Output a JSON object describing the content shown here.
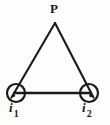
{
  "figure": {
    "name": "triangular-current-loop-diagram",
    "background_color": "#fdfdfc",
    "stroke_color": "#1a1a1a",
    "width": 110,
    "height": 125
  },
  "labels": {
    "apex": "P",
    "node_1_symbol": "i",
    "node_1_subscript": "1",
    "node_2_symbol": "i",
    "node_2_subscript": "2"
  },
  "geometry": {
    "apex": {
      "x": 55,
      "y": 23
    },
    "node_1": {
      "x": 16,
      "y": 93,
      "radius": 9
    },
    "node_2": {
      "x": 89,
      "y": 93,
      "radius": 9
    },
    "base_line": {
      "x1": 16,
      "y1": 93,
      "x2": 89,
      "y2": 93
    },
    "left_edge": {
      "x1": 55,
      "y1": 23,
      "x2": 12,
      "y2": 97
    },
    "right_edge": {
      "x1": 55,
      "y1": 23,
      "x2": 93,
      "y2": 97
    }
  },
  "icons": {
    "node_1": "current-into-page-circle-icon",
    "node_2": "current-into-page-circle-icon"
  }
}
